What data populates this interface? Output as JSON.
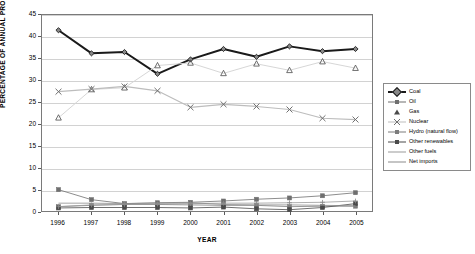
{
  "chart_data": {
    "type": "line",
    "title": "",
    "xlabel": "YEAR",
    "ylabel": "PERCENTAGE OF ANNUAL PRODUCTION",
    "categories": [
      "1996",
      "1997",
      "1998",
      "1999",
      "2000",
      "2001",
      "2002",
      "2003",
      "2004",
      "2005"
    ],
    "x": [
      1996,
      1997,
      1998,
      1999,
      2000,
      2001,
      2002,
      2003,
      2004,
      2005
    ],
    "ylim": [
      0,
      45
    ],
    "yticks": [
      0,
      5,
      10,
      15,
      20,
      25,
      30,
      35,
      40,
      45
    ],
    "grid": true,
    "legend_position": "right",
    "series": [
      {
        "name": "Coal",
        "marker": "diamond",
        "color": "#1a1a1a",
        "width": 2.0,
        "values": [
          41.5,
          36.2,
          36.5,
          31.5,
          34.8,
          37.2,
          35.4,
          37.8,
          36.7,
          37.2
        ]
      },
      {
        "name": "Oil",
        "marker": "square",
        "color": "#6f6f6f",
        "width": 0.8,
        "values": [
          4.9,
          2.6,
          1.7,
          1.9,
          2.0,
          2.3,
          2.7,
          3.0,
          3.5,
          4.2
        ]
      },
      {
        "name": "Gas",
        "marker": "triangle",
        "color": "#d6d6d6",
        "width": 1.0,
        "values": [
          21.4,
          27.9,
          28.3,
          33.4,
          34.0,
          31.6,
          33.8,
          32.3,
          34.3,
          32.8
        ]
      },
      {
        "name": "Nuclear",
        "marker": "x",
        "color": "#bdbdbd",
        "width": 1.2,
        "values": [
          27.4,
          28.0,
          28.6,
          27.6,
          23.8,
          24.5,
          24.0,
          23.3,
          21.3,
          21.0
        ]
      },
      {
        "name": "Hydro (natural flow)",
        "marker": "square",
        "color": "#7c7c7c",
        "width": 0.8,
        "values": [
          1.0,
          1.3,
          1.5,
          1.5,
          1.4,
          1.3,
          1.3,
          1.0,
          1.1,
          1.1
        ]
      },
      {
        "name": "Other renewables",
        "marker": "square",
        "color": "#4a4a4a",
        "width": 0.8,
        "values": [
          0.7,
          0.8,
          0.8,
          0.8,
          0.7,
          0.9,
          0.5,
          0.3,
          0.8,
          1.7
        ]
      },
      {
        "name": "Other fuels",
        "marker": "plus",
        "color": "#9a9a9a",
        "width": 0.8,
        "values": [
          1.0,
          1.4,
          1.5,
          1.6,
          1.7,
          1.8,
          1.8,
          1.9,
          2.0,
          2.3
        ]
      },
      {
        "name": "Net imports",
        "marker": "none",
        "color": "#8c8c8c",
        "width": 0.8,
        "values": [
          1.8,
          1.8,
          1.7,
          1.8,
          1.9,
          1.5,
          1.4,
          1.4,
          1.3,
          1.2
        ]
      }
    ]
  }
}
